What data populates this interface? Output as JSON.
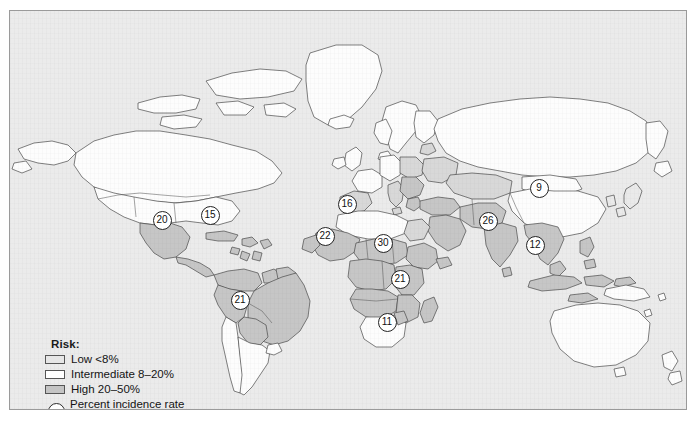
{
  "map": {
    "title": "World map of risk by country",
    "ocean_color": "#ebebeb",
    "border_color": "#9a9a9a",
    "coastline_color": "#4a4a4a",
    "colors": {
      "low": "#e6e6e6",
      "intermediate": "#ffffff",
      "high": "#c4c4c4"
    }
  },
  "legend": {
    "title": "Risk:",
    "items": [
      {
        "label": "Low <8%",
        "swatch_class": "low",
        "color": "#e6e6e6"
      },
      {
        "label": "Intermediate 8–20%",
        "swatch_class": "inter",
        "color": "#ffffff"
      },
      {
        "label": "High 20–50%",
        "swatch_class": "high",
        "color": "#c4c4c4"
      }
    ],
    "circle_note_line1": "Percent incidence rate",
    "circle_note_line2": "in the first 2 weeks",
    "circle_icon": "open-circle-icon"
  },
  "markers": [
    {
      "value": "20",
      "region": "mexico",
      "x": 160,
      "y": 218
    },
    {
      "value": "15",
      "region": "caribbean",
      "x": 208,
      "y": 213
    },
    {
      "value": "21",
      "region": "brazil",
      "x": 238,
      "y": 298
    },
    {
      "value": "16",
      "region": "north-africa",
      "x": 345,
      "y": 202
    },
    {
      "value": "22",
      "region": "west-africa",
      "x": 323,
      "y": 234
    },
    {
      "value": "30",
      "region": "central-africa",
      "x": 381,
      "y": 241
    },
    {
      "value": "21",
      "region": "east-africa",
      "x": 398,
      "y": 277
    },
    {
      "value": "11",
      "region": "southern-africa",
      "x": 385,
      "y": 320
    },
    {
      "value": "26",
      "region": "india",
      "x": 486,
      "y": 219
    },
    {
      "value": "9",
      "region": "china",
      "x": 537,
      "y": 186
    },
    {
      "value": "12",
      "region": "southeast-asia",
      "x": 533,
      "y": 243
    }
  ]
}
